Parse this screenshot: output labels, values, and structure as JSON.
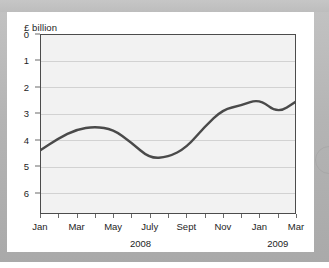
{
  "page": {
    "background_color": "#b4b4b4",
    "card_color": "#ffffff"
  },
  "decor": {
    "arc_icon": "circle-arc-decoration"
  },
  "chart_data": {
    "type": "line",
    "title": "",
    "subtitle": "",
    "ylabel": "£ billion",
    "xlabel": "",
    "unit": "£ billion",
    "grid": true,
    "legend": false,
    "y_axis_inverted": true,
    "ylim": [
      0,
      6.8
    ],
    "yticks": [
      0,
      1,
      2,
      3,
      4,
      5,
      6
    ],
    "ytick_labels": [
      "0",
      "1",
      "2",
      "3",
      "4",
      "5",
      "6"
    ],
    "x": [
      "Jan",
      "Feb",
      "Mar",
      "Apr",
      "May",
      "June",
      "July",
      "Aug",
      "Sept",
      "Oct",
      "Nov",
      "Dec",
      "Jan",
      "Feb",
      "Mar"
    ],
    "xtick_labels": [
      "Jan",
      "Mar",
      "May",
      "July",
      "Sept",
      "Nov",
      "Jan",
      "Mar"
    ],
    "xtick_label_indices": [
      0,
      2,
      4,
      6,
      8,
      10,
      12,
      14
    ],
    "year_groups": [
      {
        "label": "2008",
        "start_index": 0,
        "end_index": 11
      },
      {
        "label": "2009",
        "start_index": 12,
        "end_index": 14
      }
    ],
    "series": [
      {
        "name": "Value",
        "color": "#4a4a4a",
        "line_width": 2.4,
        "values": [
          4.4,
          3.95,
          3.6,
          3.5,
          3.6,
          4.1,
          4.7,
          4.65,
          4.3,
          3.5,
          2.85,
          2.7,
          2.45,
          3.0,
          2.55
        ]
      }
    ]
  }
}
